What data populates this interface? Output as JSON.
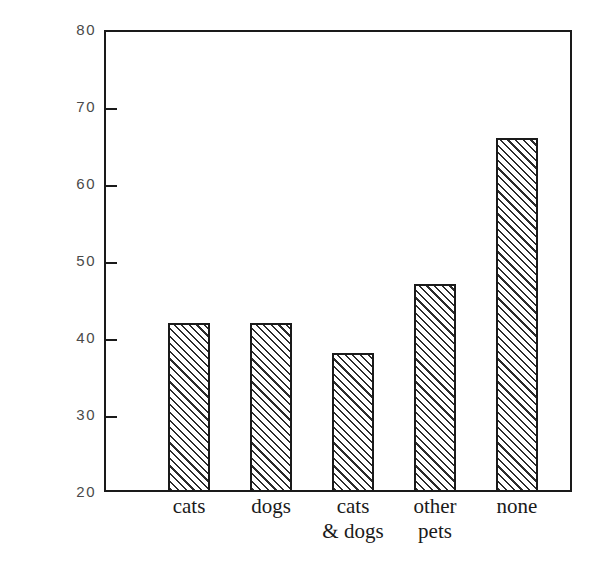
{
  "chart_data": {
    "type": "bar",
    "title": "",
    "xlabel": "",
    "ylabel": "Mean physical symptom score, 6 months",
    "categories": [
      "cats",
      "dogs",
      "cats & dogs",
      "other pets",
      "none"
    ],
    "category_lines": [
      {
        "line1": "cats",
        "line2": ""
      },
      {
        "line1": "dogs",
        "line2": ""
      },
      {
        "line1": "cats",
        "line2": "& dogs"
      },
      {
        "line1": "other",
        "line2": "pets"
      },
      {
        "line1": "none",
        "line2": ""
      }
    ],
    "values": [
      42,
      42,
      38,
      47,
      66
    ],
    "ylim": [
      20,
      80
    ],
    "y_ticks": [
      20,
      30,
      40,
      50,
      60,
      70,
      80
    ],
    "y_tick_labels": [
      "20",
      "30",
      "40",
      "50",
      "60",
      "70",
      "80"
    ],
    "grid": false,
    "legend": false,
    "bar_fill": "diagonal-hatch",
    "colors": {
      "axis": "#1a1a1a",
      "bar_outline": "#1a1a1a",
      "hatch": "#2b2b2b",
      "tick_label": "#4a4a4a",
      "background": "#ffffff"
    }
  }
}
